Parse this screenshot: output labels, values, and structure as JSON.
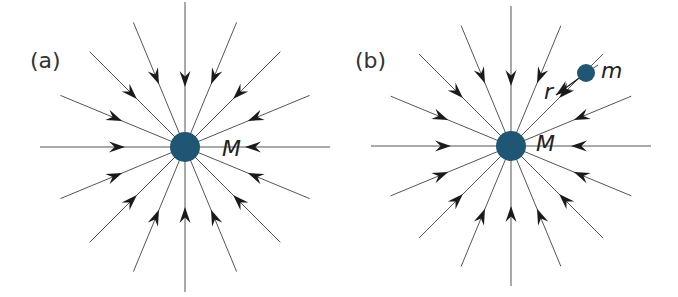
{
  "panels": [
    {
      "label": "(a)",
      "center": [
        185,
        147
      ],
      "mass_radius": 15,
      "mass_label": "M",
      "ray_length": 145
    },
    {
      "label": "(b)",
      "center": [
        511,
        146
      ],
      "mass_radius": 15,
      "mass_label": "M",
      "ray_length": 140,
      "test_mass": {
        "label": "m",
        "position": [
          586,
          73
        ],
        "radius": 9
      },
      "distance_label": "r"
    }
  ],
  "colors": {
    "mass": "#1e5674",
    "line": "#555555",
    "arrow": "#1a1a1a"
  },
  "ray_angles_deg": [
    0,
    22.5,
    45,
    67.5,
    90,
    112.5,
    135,
    157.5,
    180,
    202.5,
    225,
    247.5,
    270,
    292.5,
    315,
    337.5
  ]
}
